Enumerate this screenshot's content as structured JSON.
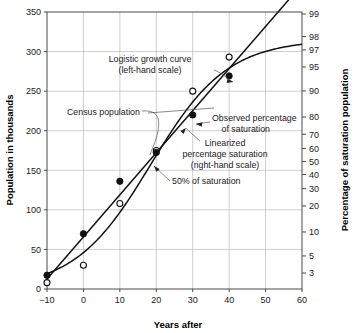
{
  "chart_data": {
    "type": "line",
    "title": "",
    "xlabel": "Years after",
    "ylabel": "Population in thousands",
    "y2label": "Percentage of saturation population",
    "xlim": [
      -10,
      60
    ],
    "ylim": [
      0,
      350
    ],
    "y2lim": [
      3,
      99
    ],
    "y2_scale": "logit",
    "grid": true,
    "legend_position": "in-plot-annotations",
    "xticks": [
      "-10",
      "0",
      "10",
      "20",
      "30",
      "40",
      "50",
      "60"
    ],
    "xtick_values": [
      -10,
      0,
      10,
      20,
      30,
      40,
      50,
      60
    ],
    "yticks": [
      "0",
      "50",
      "100",
      "150",
      "200",
      "250",
      "300",
      "350"
    ],
    "ytick_values": [
      0,
      50,
      100,
      150,
      200,
      250,
      300,
      350
    ],
    "y2ticks": [
      "3",
      "5",
      "10",
      "20",
      "30",
      "40",
      "50",
      "60",
      "70",
      "80",
      "90",
      "95",
      "97",
      "98",
      "99"
    ],
    "y2tick_values": [
      3,
      5,
      10,
      20,
      30,
      40,
      50,
      60,
      70,
      80,
      90,
      95,
      97,
      98,
      99
    ],
    "series": [
      {
        "name": "Logistic growth curve (left-hand scale)",
        "type": "line",
        "axis": "left",
        "marker": "none",
        "saturation_level": 315,
        "midpoint_year": 18.5,
        "growth_rate": 0.0955
      },
      {
        "name": "Census population",
        "type": "scatter",
        "axis": "left",
        "marker": "open-circle",
        "x": [
          -10,
          0,
          10,
          20,
          30,
          40
        ],
        "values": [
          8,
          30,
          108,
          175,
          250,
          293
        ]
      },
      {
        "name": "Observed percentage of saturation",
        "type": "scatter",
        "axis": "right",
        "marker": "filled-circle",
        "x": [
          -10,
          0,
          10,
          20,
          30,
          40
        ],
        "values": [
          2.8,
          9.5,
          35,
          57,
          81,
          93.5
        ]
      },
      {
        "name": "Linearized percentage saturation (right-hand scale)",
        "type": "line",
        "axis": "right",
        "marker": "none",
        "x": [
          -10,
          60
        ],
        "values": [
          2.5,
          99.6
        ]
      }
    ],
    "annotations": [
      {
        "name": "logistic-curve-label",
        "line1": "Logistic growth curve",
        "line2": "(left-hand scale)"
      },
      {
        "name": "census-population-label",
        "line1": "Census population"
      },
      {
        "name": "observed-percentage-label",
        "line1": "Observed percentage",
        "line2": "of saturation"
      },
      {
        "name": "linearized-label",
        "line1": "Linearized",
        "line2": "percentage saturation",
        "line3": "(right-hand scale)"
      },
      {
        "name": "fifty-percent-label",
        "line1": "50% of saturation"
      }
    ]
  },
  "axes": {
    "left_title": "Population in thousands",
    "right_title": "Percentage of saturation population",
    "bottom_title": "Years after"
  },
  "labels": {
    "logistic_l1": "Logistic growth curve",
    "logistic_l2": "(left-hand scale)",
    "census": "Census population",
    "observed_l1": "Observed percentage",
    "observed_l2": "of saturation",
    "linearized_l1": "Linearized",
    "linearized_l2": "percentage saturation",
    "linearized_l3": "(right-hand scale)",
    "fifty_pct": "50% of saturation"
  },
  "colors": {
    "curve": "#111111",
    "grid": "#b9b9b9",
    "frame": "#4a4a4a",
    "text": "#1a1a1a",
    "background": "#ffffff"
  }
}
